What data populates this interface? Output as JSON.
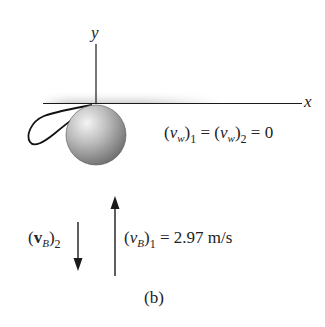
{
  "figure": {
    "caption": "(b)",
    "axes": {
      "x_label": "x",
      "y_label": "y"
    },
    "wall_velocity": {
      "var": "v",
      "sub": "w",
      "idx1": "1",
      "idx2": "2",
      "eq": "=",
      "value": "0"
    },
    "ball_velocity_after": {
      "var": "v",
      "sub": "B",
      "idx": "2",
      "direction": "down"
    },
    "ball_velocity_before": {
      "var": "v",
      "sub": "B",
      "idx": "1",
      "value": "= 2.97 m/s",
      "direction": "up"
    },
    "colors": {
      "ink": "#1a1a1a",
      "ball_light": "#e8e8e8",
      "ball_dark": "#7a7a7a",
      "wall_shade": "#cfcfcf"
    }
  }
}
